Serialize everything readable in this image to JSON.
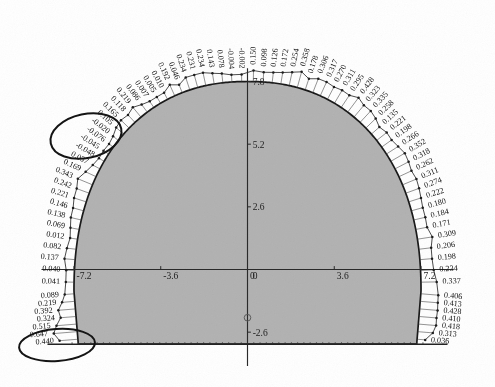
{
  "figure": {
    "type": "tunnel-cross-section-displacement-plot",
    "fill_color": "#b3b3b3",
    "outline_color": "#1a1a1a",
    "label_color": "#111111",
    "annotation_color": "#141414",
    "background_color": "#ffffff"
  },
  "axes": {
    "x_ticks": [
      "-7.2",
      "-3.6",
      "0",
      "3.6",
      "7.2"
    ],
    "x_tick_values": [
      -7.2,
      -3.6,
      0,
      3.6,
      7.2
    ],
    "y_ticks": [
      "7.8",
      "5.2",
      "2.6",
      "0",
      "-2.6"
    ],
    "y_tick_values": [
      7.8,
      5.2,
      2.6,
      0,
      -2.6
    ],
    "x_range": [
      -8.8,
      8.8
    ],
    "y_range": [
      -3.6,
      8.6
    ],
    "origin_label": "0"
  },
  "chart_data": {
    "type": "line",
    "title": "",
    "xlabel": "",
    "ylabel": "",
    "xlim": [
      -8.8,
      8.8
    ],
    "ylim": [
      -3.6,
      8.6
    ],
    "grid": false,
    "legend": "none",
    "boundary": {
      "name": "excavation-profile",
      "shape": "arch-with-flat-floor",
      "half_width": 7.2,
      "crown_height": 7.8,
      "floor_y": -3.1,
      "springline_y": 0.0
    },
    "series": [
      {
        "name": "displacement",
        "note": "values listed counter-clockwise from lower-right (floor) around the crown to lower-left (floor)",
        "values": [
          0.036,
          0.313,
          0.418,
          0.41,
          0.428,
          0.413,
          0.406,
          0.337,
          0.234,
          0.198,
          0.206,
          0.309,
          0.171,
          0.184,
          0.18,
          0.222,
          0.274,
          0.311,
          0.262,
          0.318,
          0.352,
          0.266,
          0.198,
          0.221,
          0.135,
          0.258,
          0.335,
          0.323,
          0.428,
          0.295,
          0.311,
          0.27,
          0.317,
          0.306,
          0.178,
          0.358,
          0.254,
          0.172,
          0.126,
          0.098,
          0.15,
          -0.002,
          -0.004,
          0.078,
          0.143,
          0.234,
          0.231,
          0.234,
          0.046,
          0.192,
          0.01,
          0.005,
          0.007,
          0.086,
          0.219,
          0.118,
          0.165,
          0.105,
          -0.02,
          -0.076,
          -0.045,
          -0.048,
          0.037,
          0.169,
          0.343,
          0.242,
          0.221,
          0.146,
          0.138,
          0.069,
          0.012,
          0.082,
          0.137,
          0.04,
          0.041,
          0.089,
          0.219,
          0.392,
          0.324,
          0.515,
          0.647,
          0.44
        ]
      }
    ],
    "right_side_labels": [
      "-0.004",
      "-0.002",
      "0.150",
      "0.098",
      "0.126",
      "0.172",
      "0.254",
      "0.358",
      "0.178",
      "0.306",
      "0.317",
      "0.270",
      "0.311",
      "0.295",
      "0.428",
      "0.323",
      "0.335",
      "0.258",
      "0.135",
      "0.221",
      "0.198",
      "0.266",
      "0.352",
      "0.318",
      "0.262",
      "0.311",
      "0.274",
      "0.222",
      "0.180",
      "0.184",
      "0.171",
      "0.309",
      "0.206",
      "0.198",
      "0.234",
      "0.337",
      "0.406",
      "0.413",
      "0.428",
      "0.410",
      "0.418",
      "0.313",
      "0.036"
    ],
    "left_side_labels": [
      "0.078",
      "0.143",
      "0.234",
      "0.231",
      "0.234",
      "0.046",
      "0.192",
      "0.010",
      "0.005",
      "0.007",
      "0.086",
      "0.219",
      "0.118",
      "0.165",
      "0.105",
      "-0.020",
      "-0.076",
      "-0.045",
      "-0.048",
      "0.037",
      "0.169",
      "0.343",
      "0.242",
      "0.221",
      "0.146",
      "0.138",
      "0.069",
      "0.012",
      "0.082",
      "0.137",
      "0.040",
      "0.041",
      "0.089",
      "0.219",
      "0.392",
      "0.324",
      "0.515",
      "0.647",
      "0.440"
    ]
  },
  "annotations": [
    {
      "name": "upper-left-ellipse",
      "shape": "ellipse",
      "highlights": "cluster of negative displacement values near the left haunch",
      "values": [
        "-0.020",
        "-0.076",
        "-0.045"
      ]
    },
    {
      "name": "lower-left-ellipse",
      "shape": "ellipse",
      "highlights": "cluster of largest displacement values at the left invert corner",
      "values": [
        "0.515",
        "0.647",
        "0.440"
      ]
    }
  ],
  "markers": {
    "axis_origin_marker": "small-circle-on-y-axis"
  }
}
